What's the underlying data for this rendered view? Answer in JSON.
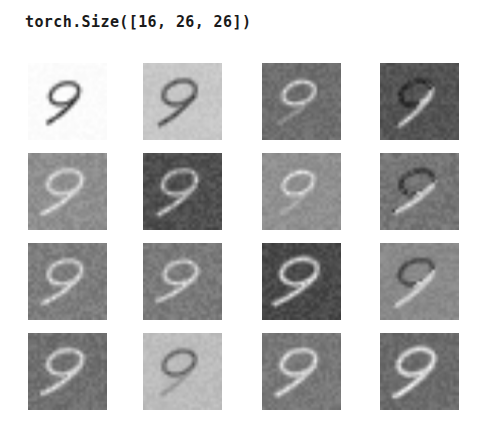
{
  "figure": {
    "title": "torch.Size([16, 26, 26])",
    "background_color": "#ffffff",
    "width": 489,
    "height": 424
  },
  "grid": {
    "rows": 4,
    "cols": 4,
    "tile_count": 16,
    "tile_label": "feature-map"
  },
  "chart_data": {
    "type": "heatmap",
    "title": "torch.Size([16, 26, 26])",
    "xlabel": "",
    "ylabel": "",
    "tensor_shape": [
      16,
      26,
      26
    ],
    "grid_rows": 4,
    "grid_cols": 4,
    "colormap": "gray",
    "digit": "9",
    "tiles": [
      {
        "index": 0,
        "row": 0,
        "col": 0,
        "background_color": "#ffffff",
        "stroke_color": "#2b2b2b",
        "polarity": "dark-on-light",
        "noise": 0.02,
        "contrast": 1.0,
        "bg_level": 252,
        "stroke_level": 35,
        "highlight_level": 225,
        "variant": "a",
        "rotation": -6,
        "scale": 0.82
      },
      {
        "index": 1,
        "row": 0,
        "col": 1,
        "background_color": "#c8c8c8",
        "stroke_color": "#3a3a3a",
        "polarity": "dark-on-light",
        "noise": 0.05,
        "contrast": 0.9,
        "bg_level": 200,
        "stroke_level": 45,
        "highlight_level": 235,
        "variant": "a",
        "rotation": -8,
        "scale": 0.92
      },
      {
        "index": 2,
        "row": 0,
        "col": 2,
        "background_color": "#6e6e6e",
        "stroke_color": "#e8e8e8",
        "polarity": "light-on-dark",
        "noise": 0.09,
        "contrast": 0.75,
        "bg_level": 110,
        "stroke_level": 232,
        "highlight_level": 250,
        "variant": "b",
        "rotation": -10,
        "scale": 0.88
      },
      {
        "index": 3,
        "row": 0,
        "col": 3,
        "background_color": "#555555",
        "stroke_color": "#efefef",
        "polarity": "light-on-dark",
        "noise": 0.1,
        "contrast": 0.8,
        "bg_level": 85,
        "stroke_level": 240,
        "highlight_level": 252,
        "variant": "c",
        "rotation": -4,
        "scale": 0.9
      },
      {
        "index": 4,
        "row": 1,
        "col": 0,
        "background_color": "#8f8f8f",
        "stroke_color": "#efefef",
        "polarity": "light-on-dark",
        "noise": 0.09,
        "contrast": 0.85,
        "bg_level": 143,
        "stroke_level": 240,
        "highlight_level": 250,
        "variant": "a",
        "rotation": -12,
        "scale": 0.95
      },
      {
        "index": 5,
        "row": 1,
        "col": 1,
        "background_color": "#4f4f4f",
        "stroke_color": "#e6e6e6",
        "polarity": "light-on-dark",
        "noise": 0.11,
        "contrast": 0.8,
        "bg_level": 79,
        "stroke_level": 230,
        "highlight_level": 248,
        "variant": "a",
        "rotation": -10,
        "scale": 0.95
      },
      {
        "index": 6,
        "row": 1,
        "col": 2,
        "background_color": "#909090",
        "stroke_color": "#f2f2f2",
        "polarity": "light-on-dark",
        "noise": 0.08,
        "contrast": 0.7,
        "bg_level": 144,
        "stroke_level": 242,
        "highlight_level": 252,
        "variant": "b",
        "rotation": -6,
        "scale": 0.86
      },
      {
        "index": 7,
        "row": 1,
        "col": 3,
        "background_color": "#767676",
        "stroke_color": "#ededed",
        "polarity": "light-on-dark",
        "noise": 0.1,
        "contrast": 0.78,
        "bg_level": 118,
        "stroke_level": 238,
        "highlight_level": 250,
        "variant": "c",
        "rotation": -14,
        "scale": 0.92
      },
      {
        "index": 8,
        "row": 2,
        "col": 0,
        "background_color": "#7d7d7d",
        "stroke_color": "#f0f0f0",
        "polarity": "light-on-dark",
        "noise": 0.1,
        "contrast": 0.82,
        "bg_level": 125,
        "stroke_level": 241,
        "highlight_level": 251,
        "variant": "a",
        "rotation": -12,
        "scale": 0.93
      },
      {
        "index": 9,
        "row": 2,
        "col": 1,
        "background_color": "#7a7a7a",
        "stroke_color": "#f0f0f0",
        "polarity": "light-on-dark",
        "noise": 0.1,
        "contrast": 0.82,
        "bg_level": 122,
        "stroke_level": 241,
        "highlight_level": 251,
        "variant": "a",
        "rotation": -16,
        "scale": 0.9
      },
      {
        "index": 10,
        "row": 2,
        "col": 2,
        "background_color": "#4a4a4a",
        "stroke_color": "#f4f4f4",
        "polarity": "light-on-dark",
        "noise": 0.11,
        "contrast": 0.9,
        "bg_level": 74,
        "stroke_level": 244,
        "highlight_level": 253,
        "variant": "a",
        "rotation": -14,
        "scale": 1.0
      },
      {
        "index": 11,
        "row": 2,
        "col": 3,
        "background_color": "#8a8a8a",
        "stroke_color": "#3c3c3c",
        "polarity": "mixed",
        "noise": 0.07,
        "contrast": 0.85,
        "bg_level": 138,
        "stroke_level": 60,
        "highlight_level": 246,
        "variant": "d",
        "rotation": -8,
        "scale": 0.95
      },
      {
        "index": 12,
        "row": 3,
        "col": 0,
        "background_color": "#707070",
        "stroke_color": "#f2f2f2",
        "polarity": "light-on-dark",
        "noise": 0.1,
        "contrast": 0.88,
        "bg_level": 112,
        "stroke_level": 242,
        "highlight_level": 252,
        "variant": "a",
        "rotation": -12,
        "scale": 0.96
      },
      {
        "index": 13,
        "row": 3,
        "col": 1,
        "background_color": "#bdbdbd",
        "stroke_color": "#474747",
        "polarity": "dark-on-light",
        "noise": 0.06,
        "contrast": 0.8,
        "bg_level": 189,
        "stroke_level": 71,
        "highlight_level": 250,
        "variant": "b",
        "rotation": -6,
        "scale": 0.9
      },
      {
        "index": 14,
        "row": 3,
        "col": 2,
        "background_color": "#787878",
        "stroke_color": "#f4f4f4",
        "polarity": "light-on-dark",
        "noise": 0.09,
        "contrast": 0.9,
        "bg_level": 120,
        "stroke_level": 244,
        "highlight_level": 253,
        "variant": "a",
        "rotation": -10,
        "scale": 0.96
      },
      {
        "index": 15,
        "row": 3,
        "col": 3,
        "background_color": "#6b6b6b",
        "stroke_color": "#fafafa",
        "polarity": "light-on-dark",
        "noise": 0.09,
        "contrast": 1.0,
        "bg_level": 107,
        "stroke_level": 250,
        "highlight_level": 255,
        "variant": "a",
        "rotation": -8,
        "scale": 1.0
      }
    ]
  }
}
